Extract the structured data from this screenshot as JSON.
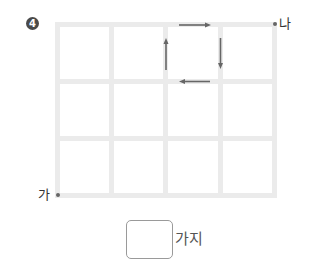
{
  "problem": {
    "number_badge": "4",
    "start_label": "가",
    "end_label": "나",
    "unit_label": "가지",
    "answer_value": ""
  },
  "grid": {
    "columns": 4,
    "rows": 3,
    "line_color": "#ebebeb"
  },
  "arrows": [
    {
      "direction": "right",
      "position": "top edge of column 3, row 1"
    },
    {
      "direction": "down",
      "position": "right edge of column 3, row 1"
    },
    {
      "direction": "left",
      "position": "bottom edge of column 3, row 1"
    },
    {
      "direction": "up",
      "position": "left edge of column 3, row 1"
    }
  ]
}
